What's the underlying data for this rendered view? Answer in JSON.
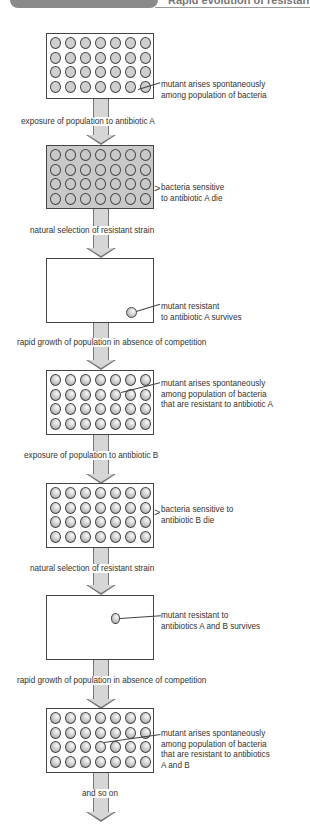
{
  "header": {
    "tab_label": "",
    "title": "Rapid evolution of resistan"
  },
  "stages": [
    {
      "id": 1,
      "type": "population",
      "fill": "light",
      "note": [
        "mutant arises spontaneously",
        "among population of bacteria"
      ]
    },
    {
      "id": 2,
      "type": "population",
      "fill": "gray",
      "note": [
        "bacteria sensitive",
        "to antibiotic A die"
      ]
    },
    {
      "id": 3,
      "type": "survivor",
      "note": [
        "mutant resistant",
        "to antibiotic A survives"
      ]
    },
    {
      "id": 4,
      "type": "population",
      "fill": "shaded",
      "note": [
        "mutant arises spontaneously",
        "among population of bacteria",
        "that are resistant to antibiotic A"
      ]
    },
    {
      "id": 5,
      "type": "population",
      "fill": "shaded",
      "note": [
        "bacteria sensitive to",
        "antibiotic B die"
      ]
    },
    {
      "id": 6,
      "type": "survivor",
      "note": [
        "mutant resistant to",
        "antibiotics A and B survives"
      ]
    },
    {
      "id": 7,
      "type": "population",
      "fill": "shaded",
      "note": [
        "mutant arises spontaneously",
        "among population of bacteria",
        "that are resistant to antibiotics",
        "A and B"
      ]
    }
  ],
  "steps": [
    "exposure of population to antibiotic A",
    "natural selection of resistant strain",
    "rapid growth of population in absence of competition",
    "exposure of population to antibiotic B",
    "natural selection of resistant strain",
    "rapid growth of population in absence of competition",
    "and so on"
  ]
}
